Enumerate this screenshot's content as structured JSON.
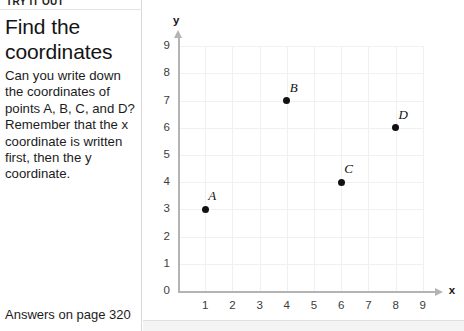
{
  "panel": {
    "eyebrow": "TRY IT OUT",
    "title": "Find the coordinates",
    "body": "Can you write down the coordinates of points A, B, C, and D? Remember that the x coordinate is written first, then the y coordinate.",
    "footer": "Answers on page 320"
  },
  "chart_data": {
    "type": "scatter",
    "title": "",
    "xlabel": "x",
    "ylabel": "y",
    "xlim": [
      0,
      9
    ],
    "ylim": [
      0,
      9
    ],
    "grid": true,
    "legend": "none",
    "xticks": [
      "1",
      "2",
      "3",
      "4",
      "5",
      "6",
      "7",
      "8",
      "9"
    ],
    "yticks": [
      "0",
      "1",
      "2",
      "3",
      "4",
      "5",
      "6",
      "7",
      "8",
      "9"
    ],
    "origin_label": "0",
    "points": [
      {
        "label": "A",
        "x": 1,
        "y": 3
      },
      {
        "label": "B",
        "x": 4,
        "y": 7
      },
      {
        "label": "C",
        "x": 6,
        "y": 4
      },
      {
        "label": "D",
        "x": 8,
        "y": 6
      }
    ]
  },
  "colors": {
    "point": "#111111",
    "axis": "#b4b4b4",
    "grid": "#f0f0f2",
    "text": "#1c1c1c"
  }
}
